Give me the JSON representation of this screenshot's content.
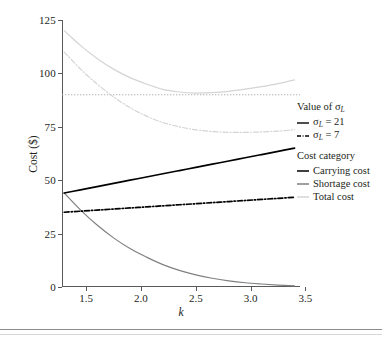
{
  "figure": {
    "background": "#ffffff",
    "frame_color": "#8c8c8c"
  },
  "chart_data": {
    "type": "line",
    "title": "",
    "xlabel": "k",
    "ylabel": "Cost ($)",
    "xlim": [
      1.28,
      3.45
    ],
    "ylim": [
      0,
      125
    ],
    "xticks": [
      1.5,
      2.0,
      2.5,
      3.0,
      3.5
    ],
    "xtick_labels": [
      "1.5",
      "2.0",
      "2.5",
      "3.0",
      "3.5"
    ],
    "yticks": [
      0,
      25,
      50,
      75,
      100,
      125
    ],
    "ytick_labels": [
      "0",
      "25",
      "50",
      "75",
      "100",
      "125"
    ],
    "grid": false,
    "legend_position": "right",
    "x": [
      1.3,
      1.45,
      1.6,
      1.75,
      1.9,
      2.05,
      2.2,
      2.35,
      2.5,
      2.65,
      2.8,
      2.95,
      3.1,
      3.25,
      3.4
    ],
    "series": [
      {
        "name": "Carrying cost, sigma_L = 21",
        "cost_category": "Carrying cost",
        "sigma_L": 21,
        "color": "#000000",
        "style": "solid",
        "values": [
          44.0,
          45.5,
          47.0,
          48.5,
          50.0,
          51.5,
          53.0,
          54.5,
          56.0,
          57.5,
          59.0,
          60.5,
          62.0,
          63.5,
          65.0
        ]
      },
      {
        "name": "Carrying cost, sigma_L = 7",
        "cost_category": "Carrying cost",
        "sigma_L": 7,
        "color": "#000000",
        "style": "dash-dot",
        "values": [
          35.0,
          35.5,
          36.0,
          36.5,
          37.0,
          37.5,
          38.0,
          38.5,
          39.0,
          39.5,
          40.0,
          40.5,
          41.0,
          41.5,
          42.0
        ]
      },
      {
        "name": "Shortage cost, sigma_L = 21",
        "cost_category": "Shortage cost",
        "sigma_L": 21,
        "color": "#808080",
        "style": "solid",
        "values": [
          44.0,
          36.0,
          29.0,
          23.0,
          18.0,
          14.0,
          10.5,
          7.8,
          5.7,
          4.1,
          2.9,
          2.0,
          1.4,
          0.9,
          0.5
        ]
      },
      {
        "name": "Shortage cost, sigma_L = 7",
        "cost_category": "Shortage cost",
        "sigma_L": 7,
        "color": "#808080",
        "style": "dash-dot",
        "values": [
          14.7,
          12.0,
          9.7,
          7.7,
          6.0,
          4.7,
          3.5,
          2.6,
          1.9,
          1.4,
          1.0,
          0.7,
          0.5,
          0.3,
          0.2
        ]
      },
      {
        "name": "Total cost, sigma_L = 21",
        "cost_category": "Total cost",
        "sigma_L": 21,
        "color": "#d4d4d4",
        "style": "solid",
        "values": [
          120.0,
          113.0,
          107.0,
          102.0,
          98.0,
          95.0,
          92.5,
          91.3,
          90.8,
          91.0,
          91.6,
          92.6,
          93.8,
          95.2,
          97.0
        ]
      },
      {
        "name": "Total cost, sigma_L = 7",
        "cost_category": "Total cost",
        "sigma_L": 7,
        "color": "#d4d4d4",
        "style": "dash-dot",
        "values": [
          110.0,
          102.0,
          95.0,
          89.0,
          84.0,
          80.0,
          77.0,
          75.0,
          73.6,
          72.8,
          72.4,
          72.4,
          72.6,
          73.0,
          73.6
        ]
      }
    ],
    "reference_lines": [
      {
        "name": "horizontal-reference",
        "orientation": "horizontal",
        "value": 90,
        "color": "#b0b0b0",
        "style": "dotted"
      }
    ],
    "annotations": []
  },
  "legend": {
    "sigma_section_title": "Value of σ",
    "sigma_subscript": "L",
    "sigma_items": [
      {
        "label_prefix": "σ",
        "label_sub": "L",
        "label_suffix": " = 21",
        "style": "solid",
        "color": "#000000"
      },
      {
        "label_prefix": "σ",
        "label_sub": "L",
        "label_suffix": " = 7",
        "style": "dash-dot",
        "color": "#000000"
      }
    ],
    "category_section_title": "Cost category",
    "category_items": [
      {
        "label": "Carrying cost",
        "color": "#000000"
      },
      {
        "label": "Shortage cost",
        "color": "#808080"
      },
      {
        "label": "Total cost",
        "color": "#d4d4d4"
      }
    ]
  }
}
